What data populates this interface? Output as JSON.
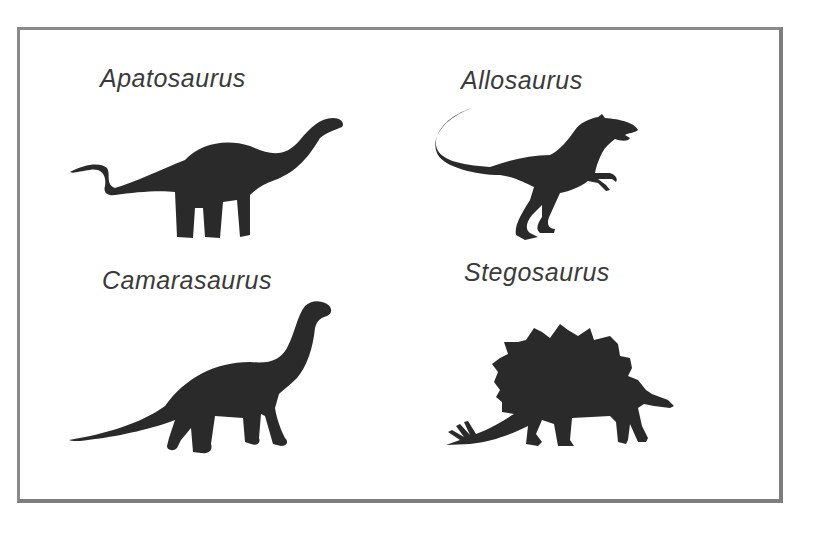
{
  "figure": {
    "dinosaurs": [
      {
        "name": "Apatosaurus",
        "position": "top-left"
      },
      {
        "name": "Allosaurus",
        "position": "top-right"
      },
      {
        "name": "Camarasaurus",
        "position": "bottom-left"
      },
      {
        "name": "Stegosaurus",
        "position": "bottom-right"
      }
    ]
  },
  "colors": {
    "silhouette": "#2a2a2a",
    "label": "#3a3a3a",
    "border": "#8a8a8a",
    "background": "#ffffff"
  }
}
